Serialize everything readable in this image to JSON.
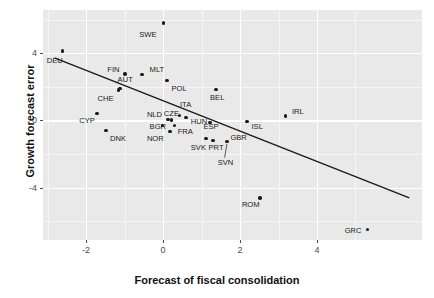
{
  "chart_data": {
    "type": "scatter",
    "title": "",
    "xlabel": "Forecast of fiscal consolidation",
    "ylabel": "Growth forecast error",
    "xlim": [
      -3.12,
      6.73
    ],
    "ylim": [
      -7.13,
      6.57
    ],
    "xticks": [
      -2,
      0,
      2,
      4
    ],
    "xtick_labels": [
      "-2",
      "0",
      "2",
      "4"
    ],
    "yticks": [
      4,
      0,
      -4
    ],
    "ytick_labels": [
      "4",
      "0",
      "-4"
    ],
    "grid": "major and minor white gridlines on grey panel",
    "legend": "none",
    "points": [
      {
        "label": "SWE",
        "x": 0.02,
        "y": 5.8,
        "lx": -0.62,
        "ly": 5.1
      },
      {
        "label": "DEU",
        "x": -2.62,
        "y": 4.13,
        "lx": -3.02,
        "ly": 3.55
      },
      {
        "label": "FIN",
        "x": -0.99,
        "y": 2.75,
        "lx": -1.45,
        "ly": 3.0
      },
      {
        "label": "MLT",
        "x": -0.55,
        "y": 2.72,
        "lx": -0.35,
        "ly": 3.02
      },
      {
        "label": "AUT",
        "x": -1.12,
        "y": 1.88,
        "lx": -1.18,
        "ly": 2.4
      },
      {
        "label": "POL",
        "x": 0.1,
        "y": 2.35,
        "lx": 0.22,
        "ly": 1.88
      },
      {
        "label": "BEL",
        "x": 1.38,
        "y": 1.85,
        "lx": 1.22,
        "ly": 1.32
      },
      {
        "label": "CHE",
        "x": -1.15,
        "y": 1.8,
        "lx": -1.7,
        "ly": 1.3
      },
      {
        "label": "ITA",
        "x": 0.42,
        "y": 0.28,
        "lx": 0.44,
        "ly": 0.92
      },
      {
        "label": "CYP",
        "x": -1.72,
        "y": 0.4,
        "lx": -2.18,
        "ly": -0.05
      },
      {
        "label": "NLD",
        "x": 0.13,
        "y": 0.05,
        "lx": -0.42,
        "ly": 0.3
      },
      {
        "label": "CZE",
        "x": 0.22,
        "y": 0.02,
        "lx": 0.02,
        "ly": 0.35
      },
      {
        "label": "HUN",
        "x": 0.6,
        "y": 0.18,
        "lx": 0.72,
        "ly": -0.12
      },
      {
        "label": "ESP",
        "x": 1.22,
        "y": -0.12,
        "lx": 1.05,
        "ly": -0.4
      },
      {
        "label": "ISL",
        "x": 2.18,
        "y": -0.08,
        "lx": 2.3,
        "ly": -0.38
      },
      {
        "label": "IRL",
        "x": 3.18,
        "y": 0.25,
        "lx": 3.35,
        "ly": 0.52
      },
      {
        "label": "BGR",
        "x": 0.18,
        "y": -0.65,
        "lx": -0.35,
        "ly": -0.38
      },
      {
        "label": "FRA",
        "x": 0.3,
        "y": -0.3,
        "lx": 0.38,
        "ly": -0.7
      },
      {
        "label": "DNK",
        "x": -1.48,
        "y": -0.62,
        "lx": -1.38,
        "ly": -1.1
      },
      {
        "label": "NOR",
        "x": -0.02,
        "y": -0.32,
        "lx": -0.42,
        "ly": -1.12
      },
      {
        "label": "SVK",
        "x": 1.12,
        "y": -1.1,
        "lx": 0.72,
        "ly": -1.62
      },
      {
        "label": "PRT",
        "x": 1.3,
        "y": -1.22,
        "lx": 1.18,
        "ly": -1.62
      },
      {
        "label": "GBR",
        "x": 1.66,
        "y": -1.28,
        "lx": 1.75,
        "ly": -1.05
      },
      {
        "label": "SVN",
        "x": 1.66,
        "y": -1.28,
        "lx": 1.42,
        "ly": -2.52
      },
      {
        "label": "ROM",
        "x": 2.52,
        "y": -4.62,
        "lx": 2.05,
        "ly": -5.05
      },
      {
        "label": "GRC",
        "x": 5.32,
        "y": -6.5,
        "lx": 4.72,
        "ly": -6.62
      }
    ],
    "trend_line": {
      "type": "linear-fit",
      "x_start": -2.82,
      "y_start": 3.72,
      "x_end": 6.4,
      "y_end": -4.62
    },
    "leader_lines": [
      {
        "from_label": "SVN",
        "x1": 1.6,
        "y1": -2.22,
        "x2": 1.66,
        "y2": -1.42
      }
    ],
    "colors": {
      "panel": "#e9e9e9",
      "gridline_major": "#ffffff",
      "gridline_minor": "#f5f5f5",
      "point": "#1a1a1a",
      "trend_line": "#1a1a1a",
      "text": "#111111",
      "tick_text": "#4d4d4d",
      "background": "#ffffff"
    }
  }
}
